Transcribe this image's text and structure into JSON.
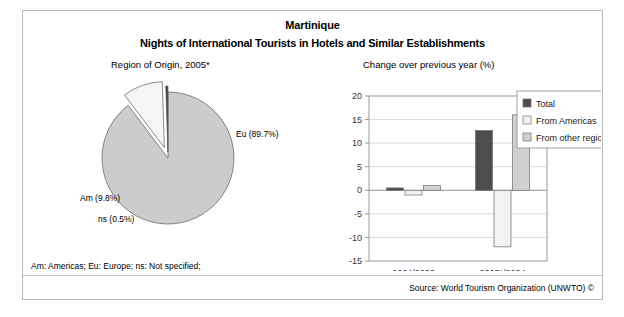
{
  "header": {
    "title": "Martinique",
    "subtitle": "Nights of International Tourists in Hotels and Similar Establishments"
  },
  "panels": {
    "pie_caption": "Region of Origin, 2005*",
    "bar_caption": "Change over previous year (%)"
  },
  "footer": {
    "abbreviations": "Am: Americas; Eu: Europe; ns: Not specified;",
    "source": "Source: World Tourism Organization (UNWTO) ©"
  },
  "colors": {
    "total": "#4d4d4d",
    "from_americas": "#f2f2f2",
    "from_other_regions": "#d0d0d0",
    "pie_eu": "#cccccc",
    "pie_am": "#f5f5f5",
    "pie_ns": "#333333",
    "frame": "#b8b8b8",
    "gridline": "#c8c8c8",
    "axis": "#808080"
  },
  "chart_data": [
    {
      "type": "pie",
      "title": "Region of Origin, 2005*",
      "labels": [
        "Eu (89.7%)",
        "Am (9.8%)",
        "ns (0.5%)"
      ],
      "slice_names": [
        "Eu",
        "Am",
        "ns"
      ],
      "values": [
        89.7,
        9.8,
        0.5
      ],
      "exploded": [
        "Am",
        "ns"
      ],
      "legend": "none"
    },
    {
      "type": "bar",
      "title": "Change over previous year (%)",
      "xlabel": "",
      "ylabel": "",
      "categories": [
        "2004/2003",
        "2005*/2004"
      ],
      "series": [
        {
          "name": "Total",
          "values": [
            0.5,
            12.7
          ]
        },
        {
          "name": "From Americas",
          "values": [
            -1.0,
            -12.0
          ]
        },
        {
          "name": "From other regions",
          "values": [
            1.0,
            16.0
          ]
        }
      ],
      "ylim": [
        -15,
        20
      ],
      "yticks": [
        20,
        15,
        10,
        5,
        0,
        -5,
        -10,
        -15
      ],
      "ytick_labels": [
        "20",
        "15",
        "10",
        "5",
        "0",
        "-5",
        "-10",
        "-15"
      ],
      "grid": true,
      "legend_position": "top-right"
    }
  ]
}
